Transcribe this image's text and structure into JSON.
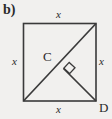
{
  "figure": {
    "part_label": "b)",
    "background_color": "#f1f0ee",
    "stroke_color": "#3a3a3a",
    "width": 112,
    "height": 119,
    "shape": "square with diagonal and perpendicular segment",
    "square": {
      "top_left": [
        23,
        23
      ],
      "top_right": [
        96,
        23
      ],
      "bottom_right": [
        96,
        101
      ],
      "bottom_left": [
        23,
        101
      ]
    },
    "side_labels": {
      "top": "x",
      "left": "x",
      "right": "x",
      "bottom": "x"
    },
    "vertices": {
      "center_point": "C",
      "bottom_right": "D"
    },
    "diagonal": {
      "from": [
        23,
        101
      ],
      "to": [
        96,
        23
      ]
    },
    "perpendicular_segment": {
      "from": [
        64,
        68
      ],
      "to": [
        96,
        101
      ]
    },
    "right_angle_marker": {
      "at": [
        64,
        68
      ],
      "size": 8,
      "shown": true
    }
  }
}
